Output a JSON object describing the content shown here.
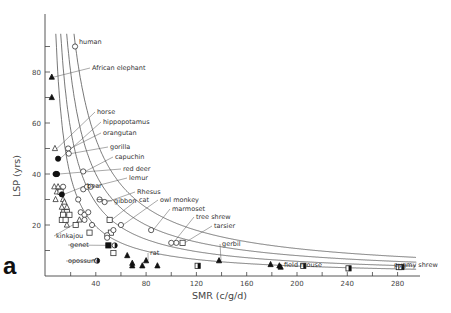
{
  "chart_data": {
    "type": "scatter",
    "panel_label": "a",
    "title": "",
    "xlabel": "SMR (c/g/d)",
    "ylabel": "LSP (yrs)",
    "xlim": [
      0,
      295
    ],
    "ylim": [
      0,
      95
    ],
    "x_ticks": [
      20,
      40,
      60,
      80,
      100,
      120,
      140,
      160,
      180,
      200,
      220,
      240,
      260,
      280
    ],
    "x_tick_labels": [
      "40",
      "80",
      "120",
      "160",
      "200",
      "240",
      "280"
    ],
    "x_tick_label_values": [
      40,
      80,
      120,
      160,
      200,
      240,
      280
    ],
    "y_ticks": [
      10,
      20,
      30,
      40,
      50,
      60,
      70,
      80,
      90
    ],
    "y_tick_labels": [
      "20",
      "40",
      "60",
      "80"
    ],
    "y_tick_label_values": [
      20,
      40,
      60,
      80
    ],
    "grid": false,
    "legend": null,
    "curves": [
      {
        "name": "curve-1",
        "type": "hyperbola",
        "k": 2150
      },
      {
        "name": "curve-2",
        "type": "hyperbola",
        "k": 1600
      },
      {
        "name": "curve-3",
        "type": "hyperbola",
        "k": 1150
      },
      {
        "name": "curve-4",
        "type": "hyperbola",
        "k": 780
      }
    ],
    "labeled_points": [
      {
        "label": "human",
        "x": 23.5,
        "y": 90,
        "marker": "circle-open"
      },
      {
        "label": "African elephant",
        "x": 5,
        "y": 78,
        "marker": "triangle-filled"
      },
      {
        "label": "horse",
        "x": 7.5,
        "y": 50,
        "marker": "triangle-open"
      },
      {
        "label": "hippopotamus",
        "x": 10,
        "y": 46,
        "marker": "circle-filled"
      },
      {
        "label": "orangutan",
        "x": 18,
        "y": 50,
        "marker": "circle-open"
      },
      {
        "label": "gorilla",
        "x": 18.5,
        "y": 48,
        "marker": "circle-open"
      },
      {
        "label": "capuchin",
        "x": 30,
        "y": 41,
        "marker": "circle-open"
      },
      {
        "label": "red deer",
        "x": 9,
        "y": 40,
        "marker": "circle-filled"
      },
      {
        "label": "lemur",
        "x": 36,
        "y": 35,
        "marker": "circle-open"
      },
      {
        "label": "Rhesus",
        "x": 47,
        "y": 29,
        "marker": "circle-open"
      },
      {
        "label": "cat",
        "x": 51,
        "y": 22,
        "marker": "square-open"
      },
      {
        "label": "owl monkey",
        "x": 60,
        "y": 20,
        "marker": "circle-open"
      },
      {
        "label": "marmoset",
        "x": 84,
        "y": 18,
        "marker": "circle-open"
      },
      {
        "label": "tree shrew",
        "x": 100,
        "y": 13,
        "marker": "circle-open"
      },
      {
        "label": "tarsier",
        "x": 109,
        "y": 13,
        "marker": "square-open"
      },
      {
        "label": "bear",
        "x": 13,
        "y": 32,
        "marker": "circle-filled"
      },
      {
        "label": "gibbon",
        "x": 43,
        "y": 30,
        "marker": "circle-cross"
      },
      {
        "label": "kinkajou",
        "x": 27,
        "y": 22,
        "marker": "triangle-open"
      },
      {
        "label": "genet",
        "x": 50,
        "y": 12,
        "marker": "square-filled"
      },
      {
        "label": "opossum",
        "x": 41,
        "y": 6,
        "marker": "circle-half"
      },
      {
        "label": "rat",
        "x": 80,
        "y": 6,
        "marker": "triangle-filled"
      },
      {
        "label": "gerbil",
        "x": 138,
        "y": 6,
        "marker": "triangle-filled"
      },
      {
        "label": "field mouse",
        "x": 187,
        "y": 3.5,
        "marker": "triangle-filled"
      },
      {
        "label": "pygmy shrew",
        "x": 283,
        "y": 3.5,
        "marker": "square-half"
      }
    ],
    "other_points": [
      {
        "x": 5,
        "y": 70,
        "marker": "triangle-filled"
      },
      {
        "x": 9,
        "y": 40,
        "marker": "circle-filled"
      },
      {
        "x": 8,
        "y": 40,
        "marker": "circle-filled"
      },
      {
        "x": 7,
        "y": 35,
        "marker": "triangle-open"
      },
      {
        "x": 10,
        "y": 35,
        "marker": "triangle-open"
      },
      {
        "x": 14,
        "y": 35,
        "marker": "circle-open"
      },
      {
        "x": 9,
        "y": 33,
        "marker": "triangle-open"
      },
      {
        "x": 12,
        "y": 33,
        "marker": "square-open"
      },
      {
        "x": 8,
        "y": 30,
        "marker": "triangle-open"
      },
      {
        "x": 14,
        "y": 30,
        "marker": "triangle-open"
      },
      {
        "x": 15,
        "y": 29,
        "marker": "triangle-open"
      },
      {
        "x": 13,
        "y": 27,
        "marker": "triangle-open"
      },
      {
        "x": 17,
        "y": 27,
        "marker": "triangle-open"
      },
      {
        "x": 15,
        "y": 25,
        "marker": "square-open"
      },
      {
        "x": 17,
        "y": 25,
        "marker": "square-open"
      },
      {
        "x": 14,
        "y": 24,
        "marker": "square-open"
      },
      {
        "x": 19,
        "y": 24,
        "marker": "square-open"
      },
      {
        "x": 13,
        "y": 22,
        "marker": "square-open"
      },
      {
        "x": 16,
        "y": 22,
        "marker": "square-open"
      },
      {
        "x": 17,
        "y": 20,
        "marker": "triangle-open"
      },
      {
        "x": 26,
        "y": 30,
        "marker": "circle-open"
      },
      {
        "x": 30,
        "y": 34,
        "marker": "circle-open"
      },
      {
        "x": 33,
        "y": 35,
        "marker": "circle-open"
      },
      {
        "x": 28,
        "y": 25,
        "marker": "circle-open"
      },
      {
        "x": 31,
        "y": 24,
        "marker": "circle-open"
      },
      {
        "x": 34,
        "y": 25,
        "marker": "circle-open"
      },
      {
        "x": 31,
        "y": 22,
        "marker": "circle-open"
      },
      {
        "x": 24,
        "y": 20,
        "marker": "square-open"
      },
      {
        "x": 37,
        "y": 20,
        "marker": "circle-open"
      },
      {
        "x": 35,
        "y": 17,
        "marker": "square-open"
      },
      {
        "x": 52,
        "y": 17,
        "marker": "square-open"
      },
      {
        "x": 49,
        "y": 16,
        "marker": "circle-open"
      },
      {
        "x": 49,
        "y": 15,
        "marker": "circle-open"
      },
      {
        "x": 54,
        "y": 18,
        "marker": "circle-open"
      },
      {
        "x": 55,
        "y": 12,
        "marker": "circle-half"
      },
      {
        "x": 54,
        "y": 9,
        "marker": "square-open"
      },
      {
        "x": 65,
        "y": 8,
        "marker": "triangle-filled"
      },
      {
        "x": 69,
        "y": 5,
        "marker": "triangle-filled"
      },
      {
        "x": 69,
        "y": 4,
        "marker": "triangle-filled"
      },
      {
        "x": 77,
        "y": 4,
        "marker": "triangle-filled"
      },
      {
        "x": 89,
        "y": 4,
        "marker": "triangle-filled"
      },
      {
        "x": 104,
        "y": 13,
        "marker": "circle-open"
      },
      {
        "x": 121,
        "y": 4,
        "marker": "square-half"
      },
      {
        "x": 179,
        "y": 4.5,
        "marker": "triangle-filled"
      },
      {
        "x": 186,
        "y": 4,
        "marker": "triangle-filled"
      },
      {
        "x": 205,
        "y": 4,
        "marker": "square-half"
      },
      {
        "x": 241,
        "y": 3,
        "marker": "square-half"
      },
      {
        "x": 281,
        "y": 3.5,
        "marker": "square-half"
      }
    ]
  }
}
